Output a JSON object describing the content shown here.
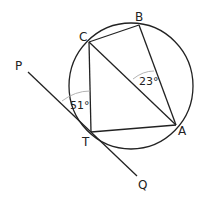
{
  "diagram": {
    "type": "circle-geometry",
    "points": {
      "A": {
        "label": "A",
        "x": 176,
        "y": 125
      },
      "B": {
        "label": "B",
        "x": 139,
        "y": 25
      },
      "C": {
        "label": "C",
        "x": 89,
        "y": 42
      },
      "T": {
        "label": "T",
        "x": 91,
        "y": 132
      },
      "P": {
        "label": "P",
        "x": 28,
        "y": 72
      },
      "Q": {
        "label": "Q",
        "x": 137,
        "y": 176
      }
    },
    "circle": {
      "cx": 131,
      "cy": 86,
      "r": 63
    },
    "segments": [
      "CB",
      "BA",
      "CA",
      "CT",
      "TA",
      "PQ"
    ],
    "angles": {
      "angle_CAB": {
        "label": "23°",
        "vertex": "A"
      },
      "angle_PTC": {
        "label": "51°",
        "vertex": "T"
      }
    },
    "colors": {
      "line": "#222222",
      "arc": "#aaaaaa"
    }
  }
}
